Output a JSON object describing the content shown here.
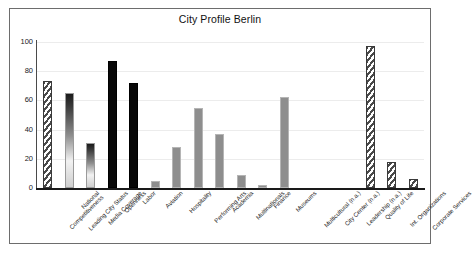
{
  "chart_data": {
    "type": "bar",
    "title": "City Profile Berlin",
    "xlabel": "",
    "ylabel": "",
    "ylim": [
      0,
      100
    ],
    "yticks": [
      0,
      20,
      40,
      60,
      80,
      100
    ],
    "grid": "horizontal",
    "legend": "none",
    "categories": [
      "National Competitiveness",
      "Leading City Status",
      "Media Coverage",
      "Openness",
      "Labor",
      "Aviation",
      "Hospitality",
      "Performing Arts",
      "Academia",
      "Multinationals",
      "Finance",
      "Museums",
      "Multicultural (n.a.)",
      "City Center (n.a.)",
      "Leadership (n.a.)",
      "Quality of Life",
      "Int. Organizations",
      "Corporate Services"
    ],
    "values": [
      73,
      65,
      31,
      87,
      72,
      5,
      28,
      55,
      37,
      9,
      2,
      62,
      0,
      0,
      0,
      97,
      18,
      6
    ],
    "bar_styles": [
      "hatch",
      "gradient",
      "gradient",
      "black",
      "black",
      "gray",
      "gray",
      "gray",
      "gray",
      "gray",
      "gray",
      "gray",
      "none",
      "none",
      "none",
      "hatch",
      "hatch",
      "hatch"
    ],
    "colors": {
      "hatch": "#4a4a4a",
      "gradient_top": "#1b1b1b",
      "gradient_bottom": "#f2f2f2",
      "black": "#080808",
      "gray": "#8e8e8e",
      "gridline": "#ececec",
      "axis": "#1a1a1a",
      "frame": "#6d6d6d",
      "text": "#1f1f1f",
      "background": "#ffffff"
    }
  },
  "category_label_lines": [
    [
      "National",
      "Competitiveness"
    ],
    [
      "Leading City Status",
      ""
    ],
    [
      "Media Coverage",
      ""
    ],
    [
      "Openness",
      ""
    ],
    [
      "Labor",
      ""
    ],
    [
      "Aviation",
      ""
    ],
    [
      "Hospitality",
      ""
    ],
    [
      "Performing Arts",
      ""
    ],
    [
      "Academia",
      ""
    ],
    [
      "Multinationals",
      ""
    ],
    [
      "Finance",
      ""
    ],
    [
      "Museums",
      ""
    ],
    [
      "Multicultural (n.a.)",
      ""
    ],
    [
      "City Center (n.a.)",
      ""
    ],
    [
      "Leadership (n.a.)",
      ""
    ],
    [
      "Quality of Life",
      ""
    ],
    [
      "Int. Organizations",
      ""
    ],
    [
      "Corporate Services",
      ""
    ]
  ]
}
